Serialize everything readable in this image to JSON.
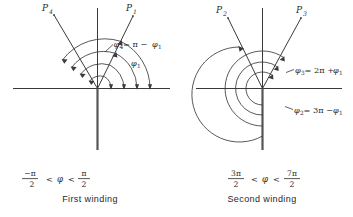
{
  "figure": {
    "title": "",
    "panels": [
      {
        "id": "first-winding",
        "caption": "First winding",
        "range": {
          "left_num": "−π",
          "left_den": "2",
          "rel1": "<",
          "variable": "φ",
          "rel2": "<",
          "right_num": "π",
          "right_den": "2"
        },
        "rays": [
          {
            "name": "P4",
            "label_base": "P",
            "label_sub": "4"
          },
          {
            "name": "P1",
            "label_base": "P",
            "label_sub": "1"
          }
        ],
        "annotations": [
          {
            "name": "phi4-equation",
            "base": "φ",
            "sub": "4",
            "rest": "= π − ",
            "base2": "φ",
            "sub2": "1"
          },
          {
            "name": "phi1-label",
            "base": "φ",
            "sub": "1",
            "rest": "",
            "base2": "",
            "sub2": ""
          }
        ]
      },
      {
        "id": "second-winding",
        "caption": "Second winding",
        "range": {
          "left_num": "3π",
          "left_den": "2",
          "rel1": "<",
          "variable": "φ",
          "rel2": "<",
          "right_num": "7π",
          "right_den": "2"
        },
        "rays": [
          {
            "name": "P2",
            "label_base": "P",
            "label_sub": "2"
          },
          {
            "name": "P3",
            "label_base": "P",
            "label_sub": "3"
          }
        ],
        "annotations": [
          {
            "name": "phi3-equation",
            "base": "φ",
            "sub": "3",
            "rest": "= 2π + ",
            "base2": "φ",
            "sub2": "1"
          },
          {
            "name": "phi2-equation",
            "base": "φ",
            "sub": "2",
            "rest": "= 3π − ",
            "base2": "φ",
            "sub2": "1"
          }
        ]
      }
    ],
    "colors": {
      "ink": "#3a3a3a",
      "text": "#2b2b2b",
      "background": "#ffffff"
    }
  }
}
